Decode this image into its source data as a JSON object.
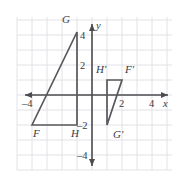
{
  "figure": {
    "plane": {
      "origin_px": [
        92,
        95
      ],
      "unit_px": 15,
      "x_range": [
        -4.9,
        6.0
      ],
      "y_range": [
        -5.2,
        5.2
      ],
      "grid": true,
      "grid_color": "#e2e2e6",
      "axis_color": "#4c4c50",
      "background": "#ffffff"
    },
    "x_axis": {
      "name": "x",
      "tick_labels": [
        {
          "text": "–4",
          "value": -4
        },
        {
          "text": "2",
          "value": 2
        },
        {
          "text": "4",
          "value": 4
        }
      ]
    },
    "y_axis": {
      "name": "y",
      "tick_labels": [
        {
          "text": "4",
          "value": 4
        },
        {
          "text": "2",
          "value": 2
        },
        {
          "text": "–2",
          "value": -2
        },
        {
          "text": "–4",
          "value": -4
        }
      ]
    },
    "shapes": [
      {
        "id": "triangle-fgh",
        "name": "triangle-fgh",
        "stroke": "#58585c",
        "fill": "none",
        "vertices": [
          {
            "label": "F",
            "x": -4,
            "y": -2
          },
          {
            "label": "G",
            "x": -1,
            "y": 4.2
          },
          {
            "label": "H",
            "x": -1,
            "y": -2
          }
        ]
      },
      {
        "id": "triangle-fghprime",
        "name": "triangle-f-prime-g-prime-h-prime",
        "stroke": "#58585c",
        "fill": "none",
        "vertices": [
          {
            "label": "H′",
            "x": 1,
            "y": 1
          },
          {
            "label": "F′",
            "x": 2,
            "y": 1
          },
          {
            "label": "G′",
            "x": 1,
            "y": -2
          }
        ]
      }
    ],
    "vertex_labels": [
      {
        "text": "G",
        "x_px": 62,
        "y_px": 23
      },
      {
        "text": "F",
        "x_px": 33,
        "y_px": 137
      },
      {
        "text": "H",
        "x_px": 71,
        "y_px": 137
      },
      {
        "text": "H′",
        "x_px": 96,
        "y_px": 73
      },
      {
        "text": "F′",
        "x_px": 125,
        "y_px": 73
      },
      {
        "text": "G′",
        "x_px": 113,
        "y_px": 138
      }
    ]
  }
}
